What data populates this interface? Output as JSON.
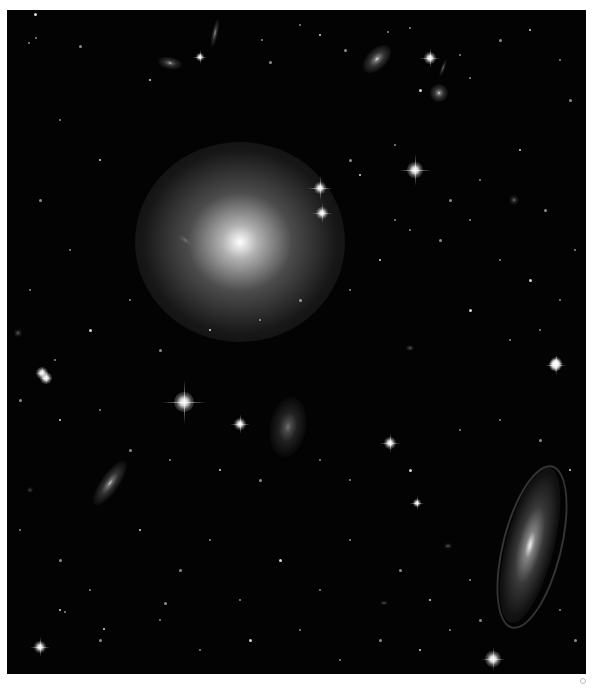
{
  "image": {
    "subject": "deep-field galaxy cluster",
    "background_color": "#030303",
    "border_color": "#ffffff",
    "field": {
      "x": 7,
      "y": 10,
      "width": 579,
      "height": 664
    }
  },
  "galaxies": [
    {
      "name": "giant-elliptical",
      "x": 240,
      "y": 242,
      "rx": 105,
      "ry": 100,
      "angle": 0,
      "core": 1.0,
      "glow": 0.75
    },
    {
      "name": "spiral-lower-right",
      "x": 530,
      "y": 545,
      "rx": 24,
      "ry": 80,
      "angle": 14,
      "core": 0.95,
      "glow": 0.55
    },
    {
      "name": "edge-on-lower-left",
      "x": 110,
      "y": 483,
      "rx": 9,
      "ry": 26,
      "angle": 35,
      "core": 0.8,
      "glow": 0.45
    },
    {
      "name": "irregular-center",
      "x": 288,
      "y": 427,
      "rx": 18,
      "ry": 30,
      "angle": 10,
      "core": 0.45,
      "glow": 0.3
    },
    {
      "name": "elliptical-top-right",
      "x": 377,
      "y": 59,
      "rx": 10,
      "ry": 17,
      "angle": 45,
      "core": 0.9,
      "glow": 0.5
    },
    {
      "name": "edge-on-top-left",
      "x": 215,
      "y": 33,
      "rx": 3,
      "ry": 14,
      "angle": 12,
      "core": 0.8,
      "glow": 0.4
    },
    {
      "name": "small-elliptical-top-left",
      "x": 170,
      "y": 63,
      "rx": 12,
      "ry": 6,
      "angle": 10,
      "core": 0.8,
      "glow": 0.4
    },
    {
      "name": "round-top-right",
      "x": 439,
      "y": 93,
      "rx": 9,
      "ry": 9,
      "angle": 0,
      "core": 0.9,
      "glow": 0.5
    },
    {
      "name": "edge-on-top-right",
      "x": 443,
      "y": 68,
      "rx": 2,
      "ry": 9,
      "angle": 20,
      "core": 0.7,
      "glow": 0.35
    },
    {
      "name": "small-galaxy-right",
      "x": 514,
      "y": 200,
      "rx": 5,
      "ry": 5,
      "angle": 0,
      "core": 0.6,
      "glow": 0.3
    },
    {
      "name": "small-galaxy-right-2",
      "x": 410,
      "y": 348,
      "rx": 4,
      "ry": 3,
      "angle": 0,
      "core": 0.7,
      "glow": 0.3
    },
    {
      "name": "small-galaxy-lower",
      "x": 448,
      "y": 546,
      "rx": 4,
      "ry": 3,
      "angle": 0,
      "core": 0.6,
      "glow": 0.3
    },
    {
      "name": "small-galaxy-lower-2",
      "x": 384,
      "y": 603,
      "rx": 4,
      "ry": 2,
      "angle": 0,
      "core": 0.6,
      "glow": 0.3
    },
    {
      "name": "small-galaxy-left",
      "x": 18,
      "y": 333,
      "rx": 4,
      "ry": 4,
      "angle": 0,
      "core": 0.7,
      "glow": 0.3
    },
    {
      "name": "small-galaxy-left-2",
      "x": 30,
      "y": 490,
      "rx": 3,
      "ry": 3,
      "angle": 0,
      "core": 0.5,
      "glow": 0.25
    },
    {
      "name": "small-galaxy-mid",
      "x": 185,
      "y": 240,
      "rx": 8,
      "ry": 3,
      "angle": 35,
      "core": 0.35,
      "glow": 0.2
    }
  ],
  "bright_stars": [
    {
      "x": 184,
      "y": 402,
      "size": 5,
      "spike": 22
    },
    {
      "x": 320,
      "y": 188,
      "size": 3,
      "spike": 12
    },
    {
      "x": 322,
      "y": 213,
      "size": 3,
      "spike": 10
    },
    {
      "x": 415,
      "y": 170,
      "size": 4,
      "spike": 16
    },
    {
      "x": 430,
      "y": 58,
      "size": 3,
      "spike": 10
    },
    {
      "x": 240,
      "y": 424,
      "size": 3,
      "spike": 10
    },
    {
      "x": 390,
      "y": 443,
      "size": 3,
      "spike": 10
    },
    {
      "x": 417,
      "y": 503,
      "size": 2,
      "spike": 7
    },
    {
      "x": 556,
      "y": 365,
      "size": 3,
      "spike": 10
    },
    {
      "x": 555,
      "y": 365,
      "size": 3,
      "spike": 8
    },
    {
      "x": 493,
      "y": 659,
      "size": 4,
      "spike": 12
    },
    {
      "x": 40,
      "y": 647,
      "size": 3,
      "spike": 10
    },
    {
      "x": 200,
      "y": 57,
      "size": 2,
      "spike": 7
    },
    {
      "x": 42,
      "y": 373,
      "size": 3,
      "spike": 6
    },
    {
      "x": 46,
      "y": 378,
      "size": 3,
      "spike": 6
    },
    {
      "x": 556,
      "y": 363,
      "size": 3,
      "spike": 8
    }
  ],
  "faint_stars": [
    [
      35,
      14
    ],
    [
      36,
      38
    ],
    [
      29,
      43
    ],
    [
      80,
      46
    ],
    [
      150,
      80
    ],
    [
      262,
      40
    ],
    [
      270,
      62
    ],
    [
      300,
      25
    ],
    [
      320,
      35
    ],
    [
      345,
      50
    ],
    [
      388,
      32
    ],
    [
      410,
      28
    ],
    [
      420,
      90
    ],
    [
      460,
      55
    ],
    [
      470,
      78
    ],
    [
      500,
      40
    ],
    [
      530,
      30
    ],
    [
      560,
      60
    ],
    [
      570,
      100
    ],
    [
      60,
      120
    ],
    [
      100,
      160
    ],
    [
      40,
      200
    ],
    [
      70,
      250
    ],
    [
      30,
      290
    ],
    [
      90,
      330
    ],
    [
      55,
      360
    ],
    [
      130,
      300
    ],
    [
      160,
      350
    ],
    [
      210,
      330
    ],
    [
      260,
      320
    ],
    [
      300,
      300
    ],
    [
      350,
      290
    ],
    [
      380,
      260
    ],
    [
      440,
      240
    ],
    [
      470,
      220
    ],
    [
      500,
      260
    ],
    [
      530,
      280
    ],
    [
      560,
      300
    ],
    [
      575,
      250
    ],
    [
      350,
      160
    ],
    [
      360,
      175
    ],
    [
      395,
      145
    ],
    [
      450,
      200
    ],
    [
      480,
      180
    ],
    [
      520,
      150
    ],
    [
      545,
      210
    ],
    [
      395,
      220
    ],
    [
      410,
      230
    ],
    [
      470,
      310
    ],
    [
      510,
      340
    ],
    [
      540,
      330
    ],
    [
      20,
      400
    ],
    [
      60,
      420
    ],
    [
      100,
      410
    ],
    [
      130,
      450
    ],
    [
      170,
      460
    ],
    [
      220,
      470
    ],
    [
      260,
      480
    ],
    [
      320,
      460
    ],
    [
      350,
      480
    ],
    [
      410,
      470
    ],
    [
      460,
      430
    ],
    [
      500,
      420
    ],
    [
      540,
      440
    ],
    [
      570,
      470
    ],
    [
      20,
      530
    ],
    [
      60,
      560
    ],
    [
      90,
      590
    ],
    [
      140,
      530
    ],
    [
      180,
      570
    ],
    [
      210,
      540
    ],
    [
      240,
      600
    ],
    [
      280,
      560
    ],
    [
      320,
      590
    ],
    [
      350,
      540
    ],
    [
      400,
      570
    ],
    [
      430,
      600
    ],
    [
      470,
      580
    ],
    [
      480,
      620
    ],
    [
      560,
      610
    ],
    [
      60,
      610
    ],
    [
      100,
      640
    ],
    [
      160,
      620
    ],
    [
      200,
      650
    ],
    [
      250,
      640
    ],
    [
      300,
      630
    ],
    [
      340,
      660
    ],
    [
      380,
      640
    ],
    [
      420,
      650
    ],
    [
      450,
      630
    ],
    [
      575,
      640
    ],
    [
      65,
      612
    ],
    [
      104,
      629
    ],
    [
      165,
      603
    ]
  ],
  "corner_mark": {
    "symbol": "small circle",
    "color": "#bdbdbd"
  }
}
